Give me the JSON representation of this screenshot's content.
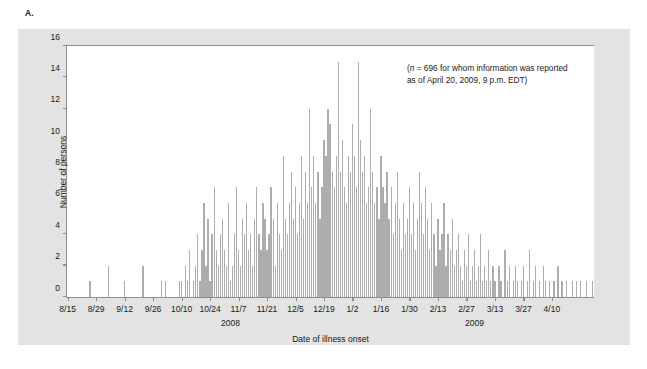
{
  "panel": {
    "label": "A."
  },
  "annotation": {
    "line1_prefix": "(",
    "line1_italic": "n",
    "line1": " = 696 for whom information was reported",
    "line2": "as of April 20, 2009, 9 p.m. EDT)"
  },
  "chart_data": {
    "type": "bar",
    "title": "",
    "xlabel": "Date of illness onset",
    "ylabel": "Number of persons",
    "ylim": [
      0,
      16
    ],
    "ytick_values": [
      0,
      2,
      4,
      6,
      8,
      10,
      12,
      14,
      16
    ],
    "grid": false,
    "legend": null,
    "bar_color": "#adadad",
    "x_start_date": "8/15",
    "x_end_date": "4/10",
    "x_tick_labels": [
      "8/15",
      "8/29",
      "9/12",
      "9/26",
      "10/10",
      "10/24",
      "11/7",
      "11/21",
      "12/5",
      "12/19",
      "1/2",
      "1/16",
      "1/30",
      "2/13",
      "2/27",
      "3/13",
      "3/27",
      "4/10"
    ],
    "x_tick_interval_days": 14,
    "group_labels": [
      {
        "text": "2008",
        "center_index": 80
      },
      {
        "text": "2009",
        "center_index": 200
      }
    ],
    "total_n": 696,
    "values": [
      0,
      0,
      0,
      0,
      0,
      0,
      0,
      0,
      0,
      0,
      0,
      1,
      0,
      0,
      0,
      0,
      0,
      0,
      0,
      0,
      2,
      0,
      0,
      0,
      0,
      0,
      0,
      0,
      1,
      0,
      0,
      0,
      0,
      0,
      0,
      0,
      0,
      2,
      0,
      0,
      0,
      0,
      0,
      0,
      0,
      0,
      1,
      0,
      1,
      0,
      0,
      0,
      0,
      0,
      0,
      1,
      1,
      0,
      2,
      1,
      3,
      0,
      1,
      2,
      4,
      1,
      3,
      6,
      2,
      5,
      1,
      4,
      7,
      3,
      2,
      4,
      5,
      3,
      2,
      6,
      1,
      2,
      4,
      7,
      3,
      2,
      5,
      4,
      6,
      3,
      4,
      2,
      5,
      7,
      4,
      3,
      6,
      5,
      3,
      4,
      7,
      5,
      2,
      6,
      4,
      3,
      9,
      5,
      4,
      6,
      8,
      5,
      7,
      4,
      6,
      9,
      5,
      8,
      6,
      12,
      7,
      9,
      6,
      8,
      5,
      7,
      10,
      9,
      12,
      11,
      8,
      7,
      9,
      15,
      8,
      10,
      7,
      6,
      9,
      8,
      11,
      9,
      7,
      15,
      10,
      8,
      9,
      6,
      7,
      12,
      8,
      6,
      7,
      5,
      9,
      7,
      6,
      8,
      5,
      7,
      4,
      6,
      8,
      5,
      3,
      6,
      4,
      5,
      7,
      4,
      6,
      3,
      5,
      8,
      6,
      4,
      7,
      5,
      3,
      6,
      4,
      2,
      5,
      3,
      4,
      6,
      2,
      4,
      3,
      5,
      2,
      3,
      4,
      2,
      1,
      3,
      2,
      4,
      1,
      2,
      3,
      1,
      2,
      4,
      1,
      2,
      1,
      3,
      1,
      2,
      1,
      0,
      2,
      1,
      0,
      3,
      1,
      2,
      0,
      1,
      2,
      1,
      0,
      1,
      2,
      0,
      1,
      3,
      0,
      1,
      2,
      0,
      1,
      0,
      2,
      1,
      0,
      1,
      0,
      1,
      0,
      2,
      0,
      1,
      0,
      1,
      0,
      0,
      1,
      0,
      1,
      0,
      1,
      0,
      0,
      1,
      0,
      0,
      1
    ]
  }
}
